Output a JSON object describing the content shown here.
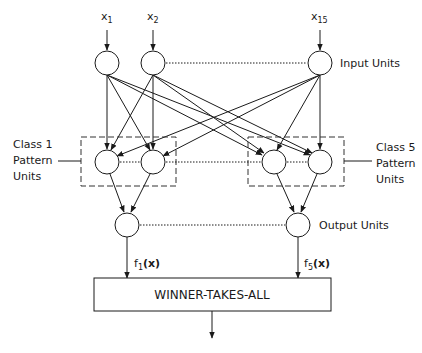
{
  "diagram": {
    "type": "probabilistic-neural-network",
    "inputs": [
      {
        "id": "x1",
        "label": "x",
        "subscript": "1"
      },
      {
        "id": "x2",
        "label": "x",
        "subscript": "2"
      },
      {
        "id": "x15",
        "label": "x",
        "subscript": "15"
      }
    ],
    "layers": {
      "input_label": "Input Units",
      "pattern_left_label": [
        "Class 1",
        "Pattern",
        "Units"
      ],
      "pattern_right_label": [
        "Class 5",
        "Pattern",
        "Units"
      ],
      "output_label": "Output Units"
    },
    "outputs": [
      {
        "id": "f1",
        "label": "f",
        "subscript": "1",
        "arg": "(x)"
      },
      {
        "id": "f5",
        "label": "f",
        "subscript": "5",
        "arg": "(x)"
      }
    ],
    "decision": {
      "label": "WINNER-TAKES-ALL"
    }
  }
}
